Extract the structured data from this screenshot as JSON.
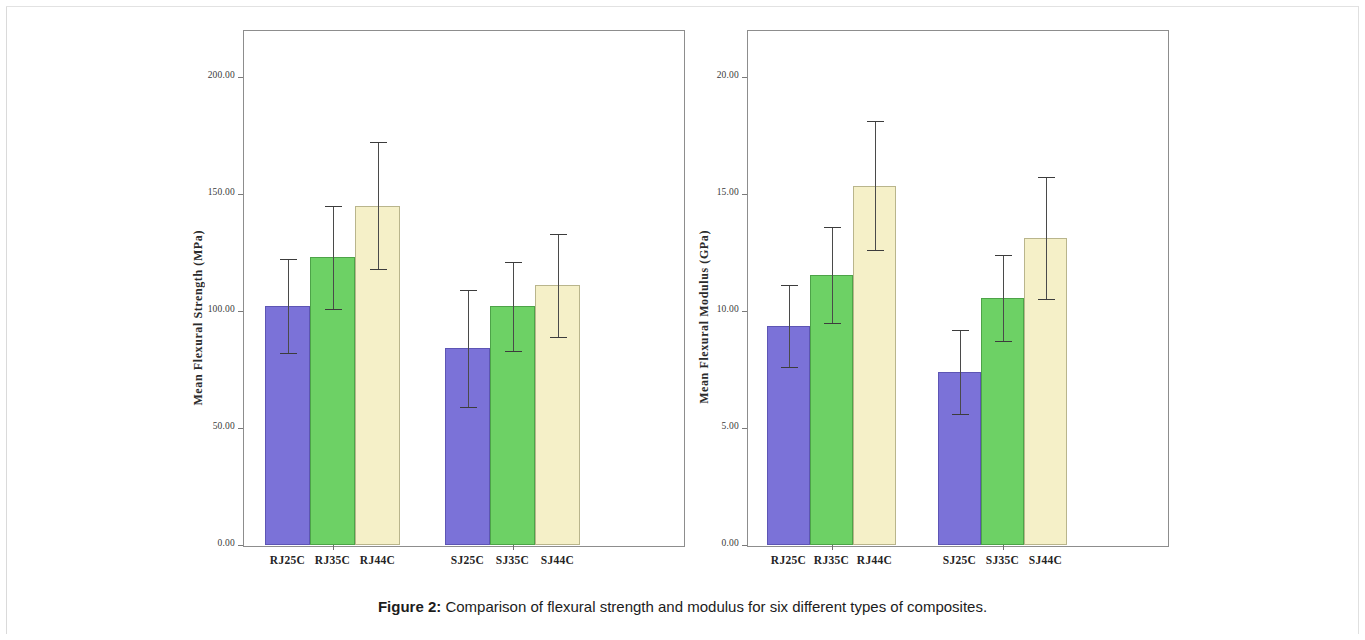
{
  "caption": {
    "label": "Figure 2:",
    "text": " Comparison of flexural strength and modulus for six different types of composites."
  },
  "colors": {
    "series_purple": "#7b72d8",
    "series_green": "#6dd165",
    "series_cream": "#f5f0c8",
    "frame": "#8d8d8d",
    "error_bar": "#4a4a4a",
    "background": "#ffffff"
  },
  "chart_data": [
    {
      "type": "bar",
      "id": "flexural-strength",
      "title": "",
      "xlabel": "",
      "ylabel": "Mean Flexural Strength (MPa)",
      "ylim": [
        0,
        220
      ],
      "yticks": [
        0,
        50,
        100,
        150,
        200
      ],
      "ytick_labels": [
        "0.00",
        "50.00",
        "100.00",
        "150.00",
        "200.00"
      ],
      "grid": false,
      "legend": "none",
      "categories": [
        "RJ25C",
        "RJ35C",
        "RJ44C",
        "SJ25C",
        "SJ35C",
        "SJ44C"
      ],
      "groups": [
        {
          "name": "RJ",
          "categories": [
            "RJ25C",
            "RJ35C",
            "RJ44C"
          ]
        },
        {
          "name": "SJ",
          "categories": [
            "SJ25C",
            "SJ35C",
            "SJ44C"
          ]
        }
      ],
      "values": [
        102,
        123,
        145,
        84,
        102,
        111
      ],
      "errors": [
        20,
        22,
        27,
        25,
        19,
        22
      ],
      "bar_colors": [
        "#7b72d8",
        "#6dd165",
        "#f5f0c8",
        "#7b72d8",
        "#6dd165",
        "#f5f0c8"
      ],
      "units": "MPa"
    },
    {
      "type": "bar",
      "id": "flexural-modulus",
      "title": "",
      "xlabel": "",
      "ylabel": "Mean Flexural Modulus (GPa)",
      "ylim": [
        0,
        22
      ],
      "yticks": [
        0,
        5,
        10,
        15,
        20
      ],
      "ytick_labels": [
        "0.00",
        "5.00",
        "10.00",
        "15.00",
        "20.00"
      ],
      "grid": false,
      "legend": "none",
      "categories": [
        "RJ25C",
        "RJ35C",
        "RJ44C",
        "SJ25C",
        "SJ35C",
        "SJ44C"
      ],
      "groups": [
        {
          "name": "RJ",
          "categories": [
            "RJ25C",
            "RJ35C",
            "RJ44C"
          ]
        },
        {
          "name": "SJ",
          "categories": [
            "SJ25C",
            "SJ35C",
            "SJ44C"
          ]
        }
      ],
      "values": [
        9.35,
        11.55,
        15.35,
        7.4,
        10.55,
        13.1
      ],
      "errors": [
        1.75,
        2.05,
        2.75,
        1.8,
        1.85,
        2.6
      ],
      "bar_colors": [
        "#7b72d8",
        "#6dd165",
        "#f5f0c8",
        "#7b72d8",
        "#6dd165",
        "#f5f0c8"
      ],
      "units": "GPa"
    }
  ]
}
